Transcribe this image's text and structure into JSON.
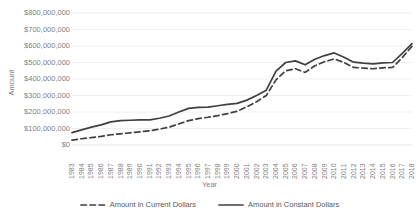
{
  "chart_data": {
    "type": "line",
    "title": "",
    "xlabel": "Year",
    "ylabel": "Amount",
    "grid": true,
    "legend_position": "bottom",
    "ylim": [
      0,
      800000000
    ],
    "ytick_values": [
      0,
      100000000,
      200000000,
      300000000,
      400000000,
      500000000,
      600000000,
      700000000,
      800000000
    ],
    "ytick_labels": [
      "$0",
      "$100,000,000",
      "$200,000,000",
      "$300,000,000",
      "$400,000,000",
      "$500,000,000",
      "$600,000,000",
      "$700,000,000",
      "$800,000,000"
    ],
    "categories": [
      "1983",
      "1984",
      "1985",
      "1986",
      "1987",
      "1988",
      "1989",
      "1990",
      "1991",
      "1992",
      "1993",
      "1994",
      "1995",
      "1996",
      "1997",
      "1998",
      "1999",
      "2000",
      "2001",
      "2002",
      "2003",
      "2004",
      "2005",
      "2006",
      "2007",
      "2008",
      "2009",
      "2010",
      "2011",
      "2012",
      "2013",
      "2014",
      "2015",
      "2016",
      "2017",
      "2018"
    ],
    "series": [
      {
        "name": "Amount in Current Dollars",
        "style": "dashed",
        "color": "#404040",
        "values": [
          30000000,
          38000000,
          45000000,
          52000000,
          62000000,
          68000000,
          74000000,
          80000000,
          86000000,
          96000000,
          108000000,
          128000000,
          148000000,
          160000000,
          168000000,
          178000000,
          190000000,
          205000000,
          232000000,
          262000000,
          300000000,
          395000000,
          450000000,
          462000000,
          440000000,
          480000000,
          505000000,
          522000000,
          500000000,
          470000000,
          466000000,
          462000000,
          468000000,
          470000000,
          530000000,
          598000000
        ]
      },
      {
        "name": "Amount in Constant Dollars",
        "style": "solid",
        "color": "#404040",
        "values": [
          75000000,
          92000000,
          108000000,
          122000000,
          140000000,
          148000000,
          150000000,
          152000000,
          152000000,
          162000000,
          176000000,
          200000000,
          222000000,
          228000000,
          230000000,
          238000000,
          246000000,
          252000000,
          272000000,
          300000000,
          332000000,
          448000000,
          500000000,
          510000000,
          486000000,
          520000000,
          542000000,
          558000000,
          532000000,
          502000000,
          496000000,
          492000000,
          498000000,
          500000000,
          556000000,
          614000000
        ]
      }
    ]
  },
  "legend": [
    {
      "label": "Amount in Current Dollars",
      "style": "dashed"
    },
    {
      "label": "Amount in Constant Dollars",
      "style": "solid"
    }
  ]
}
